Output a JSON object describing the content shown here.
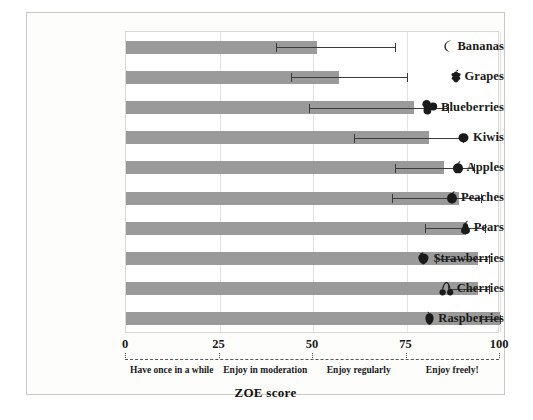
{
  "chart_data": {
    "type": "bar",
    "orientation": "horizontal",
    "title": "",
    "xlabel": "ZOE score",
    "ylabel": "",
    "xlim": [
      0,
      100
    ],
    "xticks": [
      0,
      25,
      50,
      75,
      100
    ],
    "xtick_labels": [
      "0",
      "25",
      "50",
      "75",
      "100"
    ],
    "grid": true,
    "legend": null,
    "categories": [
      "Bananas",
      "Grapes",
      "Blueberries",
      "Kiwis",
      "Apples",
      "Peaches",
      "Pears",
      "Strawberries",
      "Cherries",
      "Raspberries"
    ],
    "values": [
      51,
      57,
      77,
      81,
      85,
      89,
      91,
      94,
      94,
      100
    ],
    "error_low": [
      40,
      44,
      49,
      61,
      72,
      71,
      80,
      83,
      86,
      95
    ],
    "error_high": [
      72,
      75,
      86,
      90,
      93,
      95,
      96,
      97,
      97,
      100
    ],
    "bar_color": "#9a9a9a",
    "error_color": "#3a3a3a",
    "zones": [
      {
        "label": "Have once in a while",
        "center": 12.5
      },
      {
        "label": "Enjoy in moderation",
        "center": 37.5
      },
      {
        "label": "Enjoy regularly",
        "center": 62.5
      },
      {
        "label": "Enjoy freely!",
        "center": 87.5
      }
    ],
    "icons": [
      "banana-icon",
      "grapes-icon",
      "blueberries-icon",
      "kiwi-icon",
      "apple-icon",
      "peach-icon",
      "pear-icon",
      "strawberry-icon",
      "cherries-icon",
      "raspberry-icon"
    ]
  }
}
